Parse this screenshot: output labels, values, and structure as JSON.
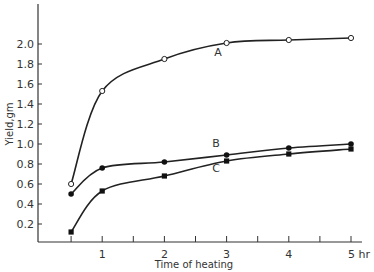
{
  "chart_data": {
    "type": "line",
    "title": "",
    "xlabel": "Time of heating",
    "ylabel": "Yield,gm",
    "x_unit": "hr",
    "xlim": [
      0,
      5
    ],
    "ylim": [
      0,
      2.2
    ],
    "grid": false,
    "legend": "inline labels",
    "x_ticks": [
      0.5,
      1,
      1.5,
      2,
      2.5,
      3,
      3.5,
      4,
      4.5,
      5
    ],
    "x_tick_labels": [
      {
        "value": 1,
        "label": "1"
      },
      {
        "value": 2,
        "label": "2"
      },
      {
        "value": 3,
        "label": "3"
      },
      {
        "value": 4,
        "label": "4"
      },
      {
        "value": 5,
        "label": "5 hr"
      }
    ],
    "y_tick_labels": [
      "0.2",
      "0.4",
      "0.6",
      "0.8",
      "1.0",
      "1.2",
      "1.4",
      "1.6",
      "1.8",
      "2.0"
    ],
    "y_tick_values": [
      0.2,
      0.4,
      0.6,
      0.8,
      1.0,
      1.2,
      1.4,
      1.6,
      1.8,
      2.0
    ],
    "series": [
      {
        "name": "A",
        "marker": "open-circle",
        "x": [
          0.5,
          1,
          2,
          3,
          4,
          5
        ],
        "values": [
          0.6,
          1.53,
          1.85,
          2.01,
          2.04,
          2.06
        ],
        "label_pos": [
          2.8,
          1.88
        ]
      },
      {
        "name": "B",
        "marker": "filled-circle",
        "x": [
          0.5,
          1,
          2,
          3,
          4,
          5
        ],
        "values": [
          0.5,
          0.76,
          0.82,
          0.89,
          0.96,
          1.0
        ],
        "label_pos": [
          2.77,
          0.97
        ]
      },
      {
        "name": "C",
        "marker": "filled-square",
        "x": [
          0.5,
          1,
          2,
          3,
          4,
          5
        ],
        "values": [
          0.12,
          0.53,
          0.68,
          0.83,
          0.9,
          0.95
        ],
        "label_pos": [
          2.77,
          0.72
        ]
      }
    ]
  }
}
